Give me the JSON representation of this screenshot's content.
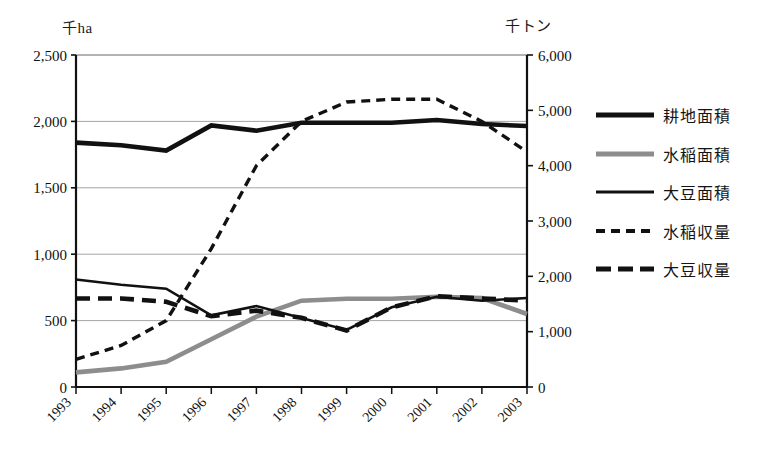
{
  "axes": {
    "left_unit": "千ha",
    "right_unit": "千トン",
    "left_ticks": [
      "2,500",
      "2,000",
      "1,500",
      "1,000",
      "500",
      "0"
    ],
    "right_ticks": [
      "6,000",
      "5,000",
      "4,000",
      "3,000",
      "2,000",
      "1,000",
      "0"
    ],
    "x_ticks": [
      "1993",
      "1994",
      "1995",
      "1996",
      "1997",
      "1998",
      "1999",
      "2000",
      "2001",
      "2002",
      "2003"
    ]
  },
  "legend": {
    "items": [
      {
        "label": "耕地面積",
        "style": "thick-solid-black",
        "color": "#111111"
      },
      {
        "label": "水稲面積",
        "style": "solid-gray",
        "color": "#8d8d8d"
      },
      {
        "label": "大豆面積",
        "style": "thin-solid-black",
        "color": "#111111"
      },
      {
        "label": "水稲収量",
        "style": "fine-dashed-black",
        "color": "#111111"
      },
      {
        "label": "大豆収量",
        "style": "thick-dashed-black",
        "color": "#111111"
      }
    ]
  },
  "chart_data": {
    "type": "line",
    "title": "",
    "xlabel": "",
    "ylabel": "千ha",
    "y2label": "千トン",
    "grid": true,
    "legend_position": "right",
    "x": [
      "1993",
      "1994",
      "1995",
      "1996",
      "1997",
      "1998",
      "1999",
      "2000",
      "2001",
      "2002",
      "2003"
    ],
    "ylim": [
      0,
      2500
    ],
    "y2lim": [
      0,
      6000
    ],
    "yticks": [
      0,
      500,
      1000,
      1500,
      2000,
      2500
    ],
    "y2ticks": [
      0,
      1000,
      2000,
      3000,
      4000,
      5000,
      6000
    ],
    "series": [
      {
        "name": "耕地面積",
        "axis": "left",
        "unit": "千ha",
        "style": "thick-solid-black",
        "color": "#111111",
        "values": [
          1840,
          1820,
          1780,
          1970,
          1930,
          1990,
          1990,
          1990,
          2010,
          1980,
          1965
        ]
      },
      {
        "name": "水稲面積",
        "axis": "left",
        "unit": "千ha",
        "style": "solid-gray",
        "color": "#8d8d8d",
        "values": [
          110,
          140,
          190,
          360,
          530,
          650,
          665,
          665,
          680,
          670,
          550
        ]
      },
      {
        "name": "大豆面積",
        "axis": "left",
        "unit": "千ha",
        "style": "thin-solid-black",
        "color": "#111111",
        "values": [
          810,
          770,
          740,
          540,
          610,
          520,
          430,
          600,
          680,
          650,
          670
        ]
      },
      {
        "name": "水稲収量",
        "axis": "right",
        "unit": "千トン",
        "style": "fine-dashed-black",
        "color": "#111111",
        "values": [
          500,
          750,
          1200,
          2500,
          4000,
          4800,
          5150,
          5200,
          5200,
          4800,
          4250
        ]
      },
      {
        "name": "大豆収量",
        "axis": "right",
        "unit": "千トン",
        "style": "thick-dashed-black",
        "color": "#111111",
        "values": [
          1600,
          1600,
          1540,
          1280,
          1380,
          1250,
          1020,
          1440,
          1640,
          1600,
          1560
        ]
      }
    ]
  }
}
